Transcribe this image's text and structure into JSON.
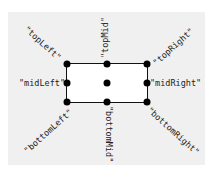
{
  "diagram": {
    "background_color": "#f0f0f0",
    "box_color": "#ffffff",
    "border_color": "#111111",
    "anchors": [
      {
        "id": "topLeft",
        "label": "\"topLeft\""
      },
      {
        "id": "topMid",
        "label": "\"topMid\""
      },
      {
        "id": "topRight",
        "label": "\"topRight\""
      },
      {
        "id": "midLeft",
        "label": "\"midLeft\""
      },
      {
        "id": "center",
        "label": ""
      },
      {
        "id": "midRight",
        "label": "\"midRight\""
      },
      {
        "id": "bottomLeft",
        "label": "\"bottomLeft\""
      },
      {
        "id": "bottomMid",
        "label": "\"bottomMid\""
      },
      {
        "id": "bottomRight",
        "label": "\"bottomRight\""
      }
    ]
  }
}
